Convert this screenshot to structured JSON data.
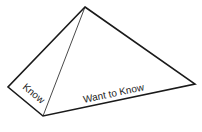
{
  "diagram": {
    "type": "pyramid",
    "faces": [
      {
        "id": "left-face",
        "label": "Know"
      },
      {
        "id": "front-face",
        "label": "Want to Know"
      }
    ],
    "vertices": {
      "apex": [
        85,
        7
      ],
      "left": [
        8,
        87
      ],
      "bottom": [
        43,
        116
      ],
      "right": [
        195,
        84
      ]
    },
    "stroke_color": "#1a1a1a"
  }
}
